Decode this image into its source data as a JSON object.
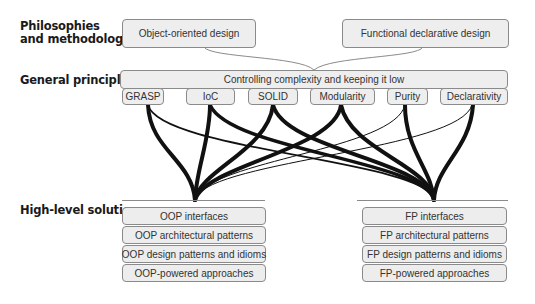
{
  "row_labels": {
    "philosophies": "Philosophies\nand methodologies",
    "philosophies_line1": "Philosophies",
    "philosophies_line2": "and methodologies",
    "principles": "General principles",
    "solutions": "High-level solutions"
  },
  "philosophies": [
    {
      "label": "Object-oriented design"
    },
    {
      "label": "Functional declarative design"
    }
  ],
  "principles_bar": {
    "label": "Controlling complexity and keeping it low"
  },
  "principles": [
    {
      "label": "GRASP"
    },
    {
      "label": "IoC"
    },
    {
      "label": "SOLID"
    },
    {
      "label": "Modularity"
    },
    {
      "label": "Purity"
    },
    {
      "label": "Declarativity"
    }
  ],
  "solutions": {
    "oop": [
      {
        "label": "OOP interfaces"
      },
      {
        "label": "OOP architectural patterns"
      },
      {
        "label": "OOP design patterns and idioms"
      },
      {
        "label": "OOP-powered approaches"
      }
    ],
    "fp": [
      {
        "label": "FP interfaces"
      },
      {
        "label": "FP architectural patterns"
      },
      {
        "label": "FP design patterns and idioms"
      },
      {
        "label": "FP-powered approaches"
      }
    ]
  },
  "colors": {
    "box_fill": "#eeeeee",
    "box_border": "#8a8a8a",
    "link": "#111111",
    "text": "#333333"
  }
}
